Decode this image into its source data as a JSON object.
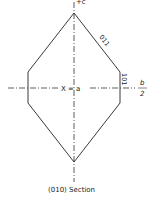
{
  "diagram": {
    "caption": "(010) Section",
    "axis_top_label": "+c",
    "axis_center_label": "X = a",
    "axis_right_label_num": "b",
    "axis_right_label_den": "2",
    "face_labels": {
      "upper_right": "011",
      "right": "101"
    },
    "line_color": "#222222"
  }
}
